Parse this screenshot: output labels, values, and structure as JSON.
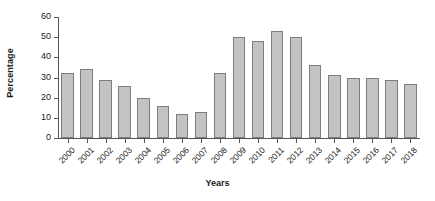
{
  "chart_data": {
    "type": "bar",
    "title": "",
    "xlabel": "Years",
    "ylabel": "Percentage",
    "categories": [
      "2000",
      "2001",
      "2002",
      "2003",
      "2004",
      "2005",
      "2006",
      "2007",
      "2008",
      "2009",
      "2010",
      "2011",
      "2012",
      "2013",
      "2014",
      "2015",
      "2016",
      "2017",
      "2018"
    ],
    "values": [
      32,
      34,
      29,
      26,
      20,
      16,
      12,
      13,
      32,
      50,
      48,
      53,
      50,
      36,
      31,
      30,
      30,
      29,
      27
    ],
    "ylim": [
      0,
      60
    ],
    "yticks": [
      0,
      10,
      20,
      30,
      40,
      50,
      60
    ],
    "ytick_labels": [
      "0",
      "10",
      "20",
      "30",
      "40",
      "50",
      "60"
    ],
    "grid": false,
    "legend": "none",
    "bar_fill_color": "#c3c3c3",
    "bar_edge_color": "#7d7d7d",
    "axis_color": "#555555",
    "text_color": "#1a1a1a",
    "background_color": "#ffffff"
  }
}
